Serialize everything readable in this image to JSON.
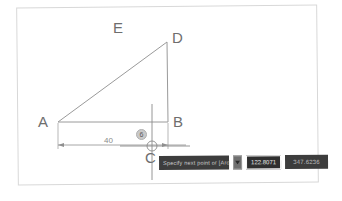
{
  "app": {
    "title": "CAD Sketch Editor"
  },
  "sketch": {
    "points": [
      {
        "id": "A",
        "label": "A",
        "x": 58,
        "y": 122,
        "label_x": 38,
        "label_y": 122
      },
      {
        "id": "B",
        "label": "B",
        "x": 168,
        "y": 122,
        "label_x": 173,
        "label_y": 122
      },
      {
        "id": "C",
        "label": "C",
        "x": 152,
        "y": 146,
        "label_x": 145,
        "label_y": 158
      },
      {
        "id": "D",
        "label": "D",
        "x": 167,
        "y": 42,
        "label_x": 172,
        "label_y": 37
      },
      {
        "id": "E",
        "label": "E",
        "x": 117,
        "y": 28,
        "label_x": 113,
        "label_y": 27
      }
    ],
    "edges": [
      {
        "name": "edge-AD",
        "from": "A",
        "to": "D"
      },
      {
        "name": "edge-DB",
        "from": "D",
        "to": "B"
      },
      {
        "name": "edge-AB",
        "from": "A",
        "to": "B"
      }
    ],
    "dimension": {
      "name": "linear-dimension-AB",
      "value": "40",
      "from_x": 58,
      "to_x": 168,
      "y": 145
    },
    "constraint_badge": {
      "name": "constraint-badge",
      "symbol": "6",
      "x": 136,
      "y": 129
    },
    "cursor": {
      "name": "crosshair-cursor",
      "x": 152,
      "y": 146,
      "snap_marker": "point-snap"
    },
    "colors": {
      "geometry_line": "#9a9a9a",
      "dimension_line": "#8f8f8f",
      "label_text": "#6e6e6e",
      "frame_border": "#d8d8d8",
      "canvas_background": "#ffffff",
      "toolbar_background": "#3d3d3d",
      "toolbar_field_active_border": "#ffffff"
    }
  },
  "input_toolbar": {
    "name": "dynamic-input-toolbar",
    "hint_text": "Specify next point or [Arc/Close/Undo]:",
    "expand_icon": "chevron-down-icon",
    "primary_field": {
      "name": "length-input",
      "value": "122.8071",
      "placeholder": "length"
    },
    "secondary_field": {
      "name": "angle-input",
      "value": "347.6236",
      "placeholder": "angle"
    }
  }
}
